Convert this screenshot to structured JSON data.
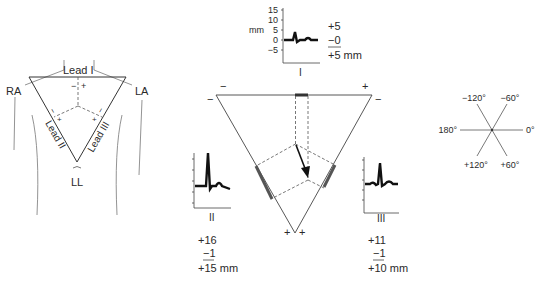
{
  "torso": {
    "ra_label": "RA",
    "la_label": "LA",
    "ll_label": "LL",
    "lead1_label": "Lead I",
    "lead2_label": "Lead II",
    "lead3_label": "Lead III",
    "minus": "−",
    "plus": "+"
  },
  "lead_I": {
    "name": "I",
    "unit_label": "mm",
    "y_ticks": [
      "15",
      "10",
      "5",
      "0",
      "−5"
    ],
    "pos": "+5",
    "neg": "−0",
    "net": "+5 mm"
  },
  "lead_II": {
    "name": "II",
    "pos": "+16",
    "neg": "−1",
    "net": "+15 mm"
  },
  "lead_III": {
    "name": "III",
    "pos": "+11",
    "neg": "−1",
    "net": "+10 mm"
  },
  "einthoven": {
    "top_left_minus": "−",
    "top_left_side_minus": "−",
    "top_right_plus": "+",
    "top_right_side_minus": "−",
    "bottom_plus_left": "+",
    "bottom_plus_right": "+"
  },
  "hexaxial": {
    "labels": {
      "m120": "−120°",
      "m60": "−60°",
      "d180": "180°",
      "d0": "0°",
      "p120": "+120°",
      "p60": "+60°"
    }
  },
  "colors": {
    "line": "#444444",
    "trace": "#111111",
    "thick_segment": "#555555"
  }
}
